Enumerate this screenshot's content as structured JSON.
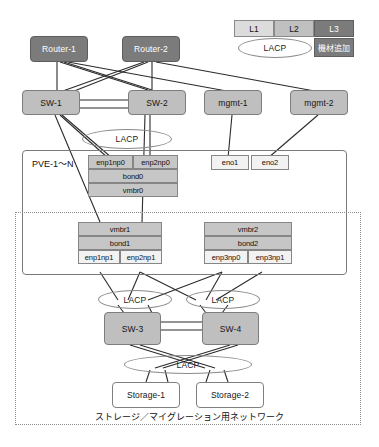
{
  "diagram": {
    "title_faint": "",
    "caption": "ストレージ／マイグレーション用ネットワーク",
    "pve_label": "PVE-1〜N",
    "lacp_label": "LACP"
  },
  "legend": {
    "l1": "L1",
    "l2": "L2",
    "l3": "L3",
    "lacp": "LACP",
    "add_equipment": "機材追加"
  },
  "nodes": {
    "router1": "Router-1",
    "router2": "Router-2",
    "sw1": "SW-1",
    "sw2": "SW-2",
    "mgmt1": "mgmt-1",
    "mgmt2": "mgmt-2",
    "sw3": "SW-3",
    "sw4": "SW-4",
    "storage1": "Storage-1",
    "storage2": "Storage-2"
  },
  "pve_stack_top": {
    "nic_left": "enp1np0",
    "nic_right": "enp2np0",
    "bond": "bond0",
    "bridge": "vmbr0"
  },
  "mgmt_nics": {
    "eno1": "eno1",
    "eno2": "eno2"
  },
  "pve_stack_mid_left": {
    "bridge": "vmbr1",
    "bond": "bond1",
    "nic_left": "enp1np1",
    "nic_right": "enp2np1"
  },
  "pve_stack_mid_right": {
    "bridge": "vmbr2",
    "bond": "bond2",
    "nic_left": "enp3np0",
    "nic_right": "enp3np1"
  },
  "lacp_groups": {
    "pve_top": "LACP",
    "sw3": "LACP",
    "sw4": "LACP",
    "storage": "LACP"
  },
  "colors": {
    "dark_node": "#7b7b7b",
    "mid_node": "#bfbfbf",
    "light_node": "#ffffff",
    "iface": "#c6c6c6",
    "line": "#2b2b2b",
    "ellipse": "#8a8a8a",
    "region": "#8d8d8d"
  }
}
